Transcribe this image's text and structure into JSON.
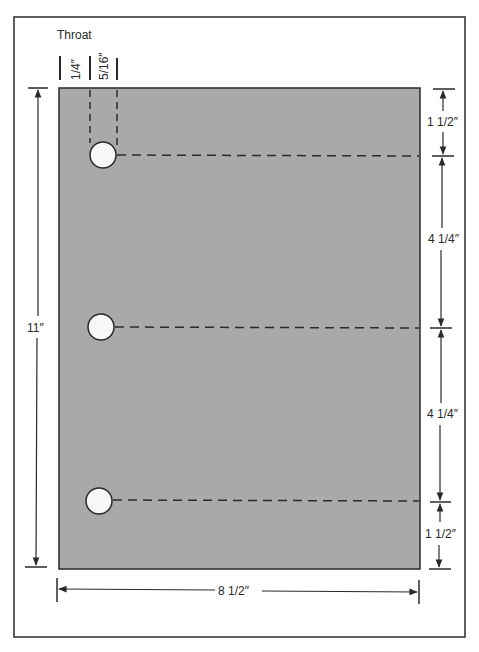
{
  "diagram": {
    "title_label": "Throat",
    "throat_offsets": [
      {
        "label": "1/4″"
      },
      {
        "label": "5/16″"
      }
    ],
    "sheet": {
      "width_label": "8 1/2″",
      "height_label": "11″",
      "fill_color": "#a9a9a9"
    },
    "hole_spacing": [
      {
        "label": "1 1/2″"
      },
      {
        "label": "4 1/4″"
      },
      {
        "label": "4 1/4″"
      },
      {
        "label": "1 1/2″"
      }
    ],
    "holes": [
      {
        "name": "top-hole"
      },
      {
        "name": "middle-hole"
      },
      {
        "name": "bottom-hole"
      }
    ],
    "colors": {
      "line": "#2a2a2a",
      "hole_fill": "#f7f7f7",
      "background": "#ffffff"
    }
  }
}
